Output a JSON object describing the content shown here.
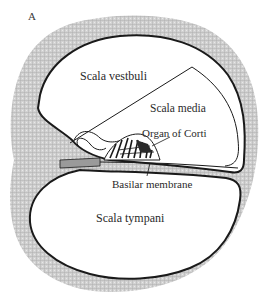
{
  "figure": {
    "panel_label": "A",
    "colors": {
      "bone_fill": "#c8c8c8",
      "outline": "#1a1a1a",
      "background": "#ffffff"
    },
    "labels": {
      "scala_vestibuli": "Scala vestbuli",
      "scala_media": "Scala media",
      "organ_of_corti": "Organ of Corti",
      "basilar_membrane": "Basilar membrane",
      "scala_tympani": "Scala tympani"
    }
  }
}
